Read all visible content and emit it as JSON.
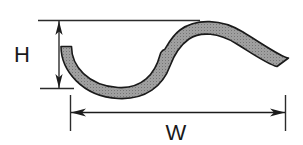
{
  "figure": {
    "kind": "engineering-dimension-diagram",
    "background_color": "#ffffff"
  },
  "dimensions": {
    "height": {
      "label": "H",
      "orientation": "vertical",
      "arrow_style": "double-ended",
      "label_x": 22,
      "label_y": 62
    },
    "width": {
      "label": "W",
      "orientation": "horizontal",
      "arrow_style": "double-ended",
      "label_x": 176,
      "label_y": 138
    }
  },
  "shape": {
    "name": "s-curve-strip",
    "fill_color": "#9a9a9a",
    "outline_color": "#1a1a1a",
    "texture": "stipple",
    "description": "S-shaped sinusoidal band, valley on the left, crest on the right"
  },
  "geometry": {
    "h_extension_top_y": 20,
    "h_extension_bottom_y": 88,
    "h_arrow_x": 59,
    "w_extension_left_x": 70,
    "w_extension_right_x": 285,
    "w_arrow_y": 112,
    "top_reference_line_x1": 38,
    "top_reference_line_x2": 200
  }
}
